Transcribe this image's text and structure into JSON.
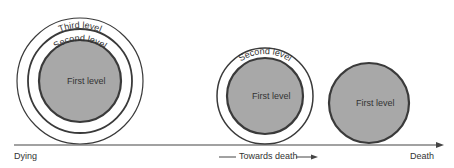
{
  "stages": [
    {
      "name": "dying",
      "levels": [
        "First level",
        "Second level",
        "Third level"
      ]
    },
    {
      "name": "towards-death",
      "levels": [
        "First level",
        "Second level"
      ]
    },
    {
      "name": "death",
      "levels": [
        "First level"
      ]
    }
  ],
  "labels": {
    "first": "First level",
    "second": "Second level",
    "third": "Third level"
  },
  "axis": {
    "start": "Dying",
    "middle": "Towards death",
    "end": "Death"
  },
  "colors": {
    "fill": "#a8a8a8",
    "stroke": "#3a3a3a",
    "line": "#444444"
  }
}
